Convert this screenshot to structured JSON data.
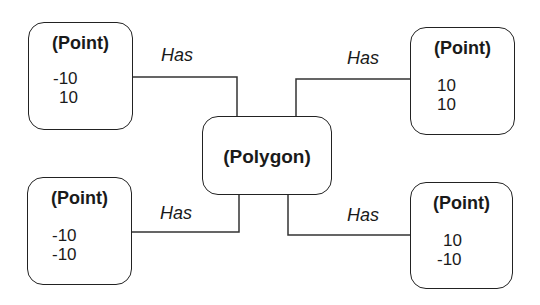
{
  "diagram": {
    "center": {
      "label": "(Polygon)"
    },
    "points": [
      {
        "position": "top-left",
        "label": "(Point)",
        "x": "-10",
        "y": "10",
        "relation": "Has"
      },
      {
        "position": "top-right",
        "label": "(Point)",
        "x": "10",
        "y": "10",
        "relation": "Has"
      },
      {
        "position": "bottom-left",
        "label": "(Point)",
        "x": "-10",
        "y": "-10",
        "relation": "Has"
      },
      {
        "position": "bottom-right",
        "label": "(Point)",
        "x": "10",
        "y": "-10",
        "relation": "Has"
      }
    ]
  }
}
